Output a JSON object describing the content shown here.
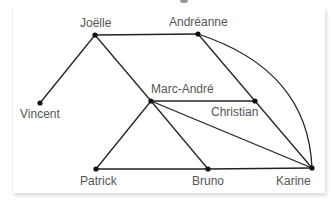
{
  "diagram": {
    "type": "graph",
    "nodes": [
      {
        "id": "joelle",
        "label": "Joëlle",
        "x": 95,
        "y": 35
      },
      {
        "id": "andreanne",
        "label": "Andréanne",
        "x": 198,
        "y": 34
      },
      {
        "id": "vincent",
        "label": "Vincent",
        "x": 40,
        "y": 103
      },
      {
        "id": "marcandre",
        "label": "Marc-André",
        "x": 151,
        "y": 101
      },
      {
        "id": "christian",
        "label": "Christian",
        "x": 255,
        "y": 101
      },
      {
        "id": "patrick",
        "label": "Patrick",
        "x": 96,
        "y": 169
      },
      {
        "id": "bruno",
        "label": "Bruno",
        "x": 208,
        "y": 169
      },
      {
        "id": "karine",
        "label": "Karine",
        "x": 312,
        "y": 168
      }
    ],
    "edges": [
      [
        "joelle",
        "andreanne"
      ],
      [
        "joelle",
        "vincent"
      ],
      [
        "joelle",
        "marcandre"
      ],
      [
        "andreanne",
        "christian"
      ],
      [
        "christian",
        "karine"
      ],
      [
        "andreanne",
        "karine",
        "curved"
      ],
      [
        "marcandre",
        "christian"
      ],
      [
        "marcandre",
        "karine"
      ],
      [
        "marcandre",
        "patrick"
      ],
      [
        "marcandre",
        "bruno"
      ],
      [
        "patrick",
        "bruno"
      ],
      [
        "bruno",
        "karine"
      ]
    ],
    "labels": {
      "joelle": "Joëlle",
      "andreanne": "Andréanne",
      "vincent": "Vincent",
      "marcandre": "Marc-André",
      "christian": "Christian",
      "patrick": "Patrick",
      "bruno": "Bruno",
      "karine": "Karine"
    },
    "colors": {
      "edge": "#222222",
      "node": "#111111",
      "label": "#555555"
    }
  }
}
